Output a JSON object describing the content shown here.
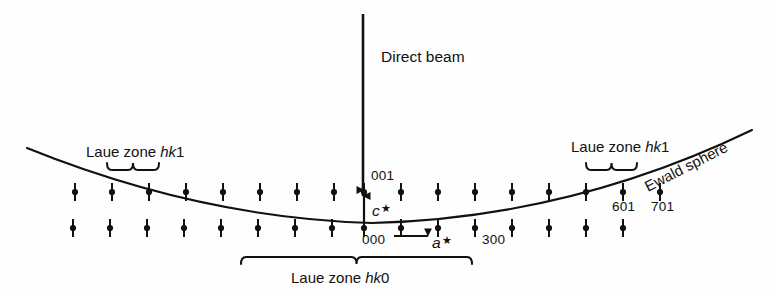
{
  "figure": {
    "background_color": "#fefefe",
    "ink_color": "#111111"
  },
  "beam": {
    "label": "Direct beam",
    "arrow_name": "direct-beam-arrow",
    "x": 363,
    "y_start": 14,
    "y_end": 196,
    "label_x": 381,
    "label_y": 62
  },
  "ewald": {
    "label": "Ewald sphere",
    "label_rotation_deg": -27,
    "label_x": 648,
    "label_y": 192,
    "curve_start": {
      "x": 27,
      "y": 148
    },
    "curve_vertex": {
      "x": 372,
      "y": 223
    },
    "curve_end": {
      "x": 752,
      "y": 130
    }
  },
  "zones": [
    {
      "name": "laue-zone-left",
      "label_prefix": "Laue zone ",
      "label_italic": "hk",
      "label_suffix": "1",
      "label_x": 86,
      "label_y": 157,
      "brace_x1": 107,
      "brace_x2": 159,
      "brace_y": 170,
      "brace_direction": "up"
    },
    {
      "name": "laue-zone-right",
      "label_prefix": "Laue zone ",
      "label_italic": "hk",
      "label_suffix": "1",
      "label_x": 571,
      "label_y": 152,
      "brace_x1": 586,
      "brace_x2": 637,
      "brace_y": 170,
      "brace_direction": "up"
    },
    {
      "name": "laue-zone-bottom",
      "label_prefix": "Laue zone ",
      "label_italic": "hk",
      "label_suffix": "0",
      "label_x": 291,
      "label_y": 283,
      "brace_x1": 241,
      "brace_x2": 472,
      "brace_y": 257,
      "brace_direction": "down"
    }
  ],
  "reflections": [
    {
      "id": "001",
      "label": "001",
      "label_x": 371,
      "label_y": 180,
      "row": "upper"
    },
    {
      "id": "000",
      "label": "000",
      "label_x": 362,
      "label_y": 244,
      "row": "lower"
    },
    {
      "id": "300",
      "label": "300",
      "label_x": 482,
      "label_y": 244,
      "row": "lower"
    },
    {
      "id": "601",
      "label": "601",
      "label_x": 612,
      "label_y": 211,
      "row": "upper"
    },
    {
      "id": "701",
      "label": "701",
      "label_x": 651,
      "label_y": 211,
      "row": "upper"
    }
  ],
  "vectors": [
    {
      "name": "c-star-vector",
      "label_letter": "c",
      "label_star": "★",
      "label_x": 372,
      "label_y": 216,
      "direction": "up",
      "x": 364,
      "y_tail": 224,
      "y_head": 190
    },
    {
      "name": "a-star-vector",
      "label_letter": "a",
      "label_star": "★",
      "label_x": 432,
      "label_y": 248,
      "direction": "right",
      "y": 236,
      "x_tail": 394,
      "x_head": 428
    }
  ],
  "lattice": {
    "point_style": "dot-with-vertical-bar",
    "dot_radius": 3.1,
    "bar_half_height": 9,
    "row_upper_y": 192,
    "row_lower_y": 228,
    "spacing": 37,
    "upper_row_x": [
      75,
      112,
      149,
      186,
      223,
      260,
      297,
      334,
      364,
      401,
      438,
      475,
      512,
      549,
      586,
      623,
      660
    ],
    "lower_row_x": [
      73,
      110,
      147,
      184,
      221,
      258,
      295,
      332,
      364,
      401,
      438,
      475,
      512,
      549,
      586,
      623
    ]
  }
}
